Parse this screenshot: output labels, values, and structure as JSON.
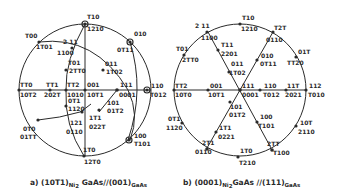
{
  "figure": {
    "panel_a": {
      "caption_prefix": "a) (10T1)",
      "caption_sub1": "Ni",
      "caption_sub1b": "2",
      "caption_mid": " GaAs//(001)",
      "caption_sub2": "GaAs",
      "labels": {
        "top_upper": "T10",
        "top_lower": "1210",
        "p100_upper": "T00",
        "p100_lower": "1T01",
        "p211_upper": "2 11",
        "p211_lower": "1100",
        "p010_upper": "010",
        "p010_lower": "0T11",
        "p101_upper": "T01",
        "p101_lower": "2TT0",
        "p011_upper": "011",
        "p011_lower": "1T02",
        "left_upper": "TT0",
        "left_lower": "10T2",
        "ptt1_upper": "TT1",
        "ptt1_lower": "202T",
        "ptt2_upper": "TT2",
        "ptt2_lower": "1010",
        "p001_upper": "001",
        "p001_lower": "10T1",
        "p111_upper": "111",
        "p111_lower": "0001",
        "right_upper": "110",
        "right_lower": "T012",
        "p0t1_upper": "0T1",
        "p0t1_lower": "1120",
        "pr101_upper": "101",
        "pr101_lower": "01T2",
        "p1t1_upper": "1T1",
        "p1t1_lower": "022T",
        "p121_upper": "121",
        "p121_lower": "0110",
        "p0t0_upper": "0T0",
        "p0t0_lower": "01TT",
        "p100r_upper": "100",
        "p100r_lower": "T101",
        "bottom_upper": "1T0",
        "bottom_lower": "12T0"
      }
    },
    "panel_b": {
      "caption_prefix": "b) (0001)",
      "caption_sub1": "Ni",
      "caption_sub1b": "2",
      "caption_mid": "GaAs //(111)",
      "caption_sub2": "GaAs",
      "labels": {
        "top_upper": "T10",
        "top_lower": "1210",
        "p211_upper": "2 11",
        "p211_lower": "1100",
        "pt21_upper": "T2T",
        "pt21_lower": "0110",
        "pt01_upper": "T01",
        "pt01_lower": "2TT0",
        "pt11_upper": "T11",
        "pt11_lower": "2201",
        "p010_upper": "010",
        "p010_lower": "0T11",
        "p01t_upper": "01T",
        "p01t_lower": "TT20",
        "p011_upper": "011",
        "p011_lower": "1T02",
        "left_upper": "TT2",
        "left_lower": "10T0",
        "p001_upper": "001",
        "p001_lower": "10T1",
        "p111_upper": "111",
        "p111_lower": "0001",
        "p110_upper": "110",
        "p110_lower": "T012",
        "p11t_upper": "11T",
        "p11t_lower": "2021",
        "right_upper": "112",
        "right_lower": "T010",
        "p0t1_upper": "0T1",
        "p0t1_lower": "1120",
        "p101_upper": "101",
        "p101_lower": "01T2",
        "p1t1_upper": "1T1",
        "p1t1_lower": "0221",
        "p100_upper": "100",
        "p100_lower": "T101",
        "p10t_upper": "10T",
        "p10t_lower": "2110",
        "p2t1_upper": "2T1",
        "p2t1_lower": "0110",
        "p2tt_upper": "2TT",
        "p2tt_lower": "T100",
        "bottom_upper": "1T0",
        "bottom_lower": "T210"
      }
    }
  }
}
